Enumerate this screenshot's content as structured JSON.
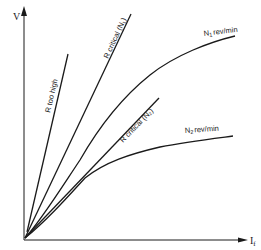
{
  "diagram": {
    "type": "generator-characteristics",
    "axes": {
      "y_label": "V",
      "x_label_main": "I",
      "x_label_sub": "f"
    },
    "lines": {
      "r_too_high": "R too high",
      "r_critical_n1": "R critical (N₁)",
      "r_critical_n2": "R critical (N₂)"
    },
    "curves": {
      "n1_main": "N",
      "n1_sub": "1",
      "n1_unit": "rev/min",
      "n2_main": "N",
      "n2_sub": "2",
      "n2_unit": "rev/min"
    },
    "colors": {
      "ink": "#1a1a1a",
      "background": "#ffffff"
    }
  }
}
